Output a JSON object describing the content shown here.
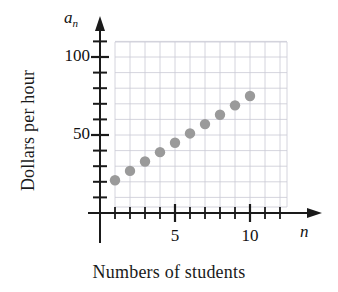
{
  "figure": {
    "xlabel": "Numbers of students",
    "ylabel": "Dollars per hour",
    "x_var_symbol": "n",
    "y_var_symbol": "a",
    "y_var_subscript": "n",
    "point_color": "#9a9a9a",
    "axis_color": "#1a1a1a",
    "grid_color": "#c9c9d4"
  },
  "y_axis": {
    "labels": [
      {
        "text": "100",
        "value": 100
      },
      {
        "text": "50",
        "value": 50
      }
    ]
  },
  "x_axis": {
    "labels": [
      {
        "text": "5",
        "value": 5
      },
      {
        "text": "10",
        "value": 10
      }
    ]
  },
  "chart_data": {
    "type": "scatter",
    "title": "",
    "xlabel": "Numbers of students",
    "ylabel": "Dollars per hour",
    "x": [
      1,
      2,
      3,
      4,
      5,
      6,
      7,
      8,
      9,
      10
    ],
    "y": [
      21,
      27,
      33,
      39,
      45,
      51,
      57,
      63,
      69,
      75
    ],
    "series": [
      {
        "name": "Dollars per hour",
        "x": [
          1,
          2,
          3,
          4,
          5,
          6,
          7,
          8,
          9,
          10
        ],
        "values": [
          21,
          27,
          33,
          39,
          45,
          51,
          57,
          63,
          69,
          75
        ]
      }
    ],
    "xlim": [
      0,
      12
    ],
    "ylim": [
      0,
      110
    ],
    "x_tick_values": [
      1,
      2,
      3,
      4,
      5,
      6,
      7,
      8,
      9,
      10,
      11,
      12
    ],
    "x_labeled_ticks": [
      5,
      10
    ],
    "y_tick_values": [
      10,
      20,
      30,
      40,
      50,
      60,
      70,
      80,
      90,
      100,
      110
    ],
    "y_labeled_ticks": [
      50,
      100
    ],
    "grid": true,
    "legend": "none",
    "marker": "circle"
  }
}
